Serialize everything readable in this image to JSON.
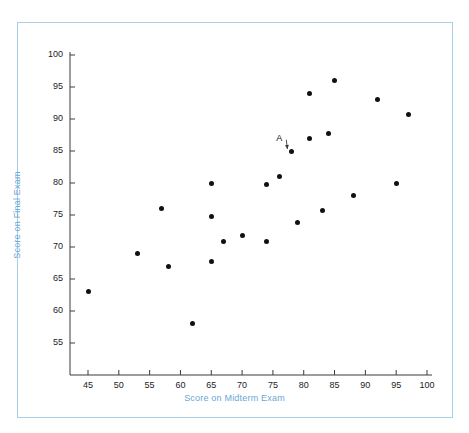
{
  "chart_data": {
    "type": "scatter",
    "title": "",
    "xlabel": "Score on Midterm Exam",
    "ylabel": "Score on Final Exam",
    "xlim": [
      42,
      101
    ],
    "ylim": [
      52,
      101
    ],
    "xticks": [
      45,
      50,
      55,
      60,
      65,
      70,
      75,
      80,
      85,
      90,
      95,
      100
    ],
    "yticks": [
      55,
      60,
      65,
      70,
      75,
      80,
      85,
      90,
      95,
      100
    ],
    "xtick_labels": [
      "45",
      "50",
      "55",
      "60",
      "65",
      "70",
      "75",
      "80",
      "85",
      "90",
      "95",
      "100"
    ],
    "ytick_labels": [
      "55",
      "60",
      "65",
      "70",
      "75",
      "80",
      "85",
      "90",
      "95",
      "100"
    ],
    "grid": false,
    "legend": null,
    "marker": "filled-circle",
    "marker_color": "#111111",
    "axis_label_color": "#6aa8d8",
    "frame_color": "#a9cfe6",
    "points": [
      {
        "x": 45,
        "y": 63
      },
      {
        "x": 53,
        "y": 69
      },
      {
        "x": 57,
        "y": 76
      },
      {
        "x": 58,
        "y": 67
      },
      {
        "x": 62,
        "y": 58
      },
      {
        "x": 65,
        "y": 80
      },
      {
        "x": 65,
        "y": 74.8
      },
      {
        "x": 65,
        "y": 67.8
      },
      {
        "x": 67,
        "y": 70.8
      },
      {
        "x": 70,
        "y": 71.8
      },
      {
        "x": 74,
        "y": 79.8
      },
      {
        "x": 74,
        "y": 70.8
      },
      {
        "x": 76,
        "y": 81
      },
      {
        "x": 78,
        "y": 85
      },
      {
        "x": 79,
        "y": 73.8
      },
      {
        "x": 81,
        "y": 94
      },
      {
        "x": 81,
        "y": 87
      },
      {
        "x": 83,
        "y": 75.7
      },
      {
        "x": 84,
        "y": 87.8
      },
      {
        "x": 85,
        "y": 96
      },
      {
        "x": 88,
        "y": 78
      },
      {
        "x": 92,
        "y": 93
      },
      {
        "x": 95,
        "y": 80
      },
      {
        "x": 97,
        "y": 90.7
      }
    ],
    "annotations": [
      {
        "label": "A",
        "label_x": 76.2,
        "label_y": 86.9,
        "target_x": 78,
        "target_y": 85,
        "arrow": true
      }
    ]
  }
}
